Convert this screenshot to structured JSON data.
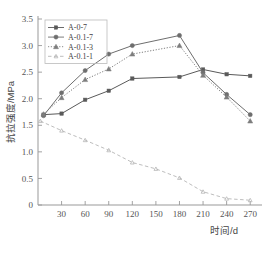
{
  "chart_data": {
    "type": "line",
    "title": "",
    "xlabel": "时间/d",
    "ylabel": "抗拉强度/MPa",
    "xlim": [
      0,
      285
    ],
    "ylim": [
      0,
      3.5
    ],
    "xticks": [
      30,
      60,
      90,
      120,
      150,
      180,
      210,
      240,
      270
    ],
    "xtick_labels": [
      "30",
      "60",
      "90",
      "120",
      "150",
      "180",
      "210",
      "240",
      "270"
    ],
    "yticks": [
      0,
      0.5,
      1.0,
      1.5,
      2.0,
      2.5,
      3.0,
      3.5
    ],
    "ytick_labels": [
      "0",
      "0.5",
      "1.0",
      "1.5",
      "2.0",
      "2.5",
      "3.0",
      "3.5"
    ],
    "grid": false,
    "legend_position": "upper-left",
    "series": [
      {
        "name": "A-0-7",
        "marker": "square",
        "linestyle": "solid",
        "color": "#5a5a5a",
        "x": [
          7,
          30,
          60,
          90,
          120,
          180,
          210,
          240,
          270
        ],
        "values": [
          1.7,
          1.72,
          1.98,
          2.15,
          2.38,
          2.41,
          2.55,
          2.46,
          2.43
        ]
      },
      {
        "name": "A-0.1-7",
        "marker": "circle",
        "linestyle": "solid",
        "color": "#6e6e6e",
        "x": [
          7,
          30,
          60,
          90,
          120,
          180,
          210,
          240,
          270
        ],
        "values": [
          1.68,
          2.11,
          2.53,
          2.84,
          3.0,
          3.19,
          2.49,
          2.08,
          1.7
        ]
      },
      {
        "name": "A-0.1-3",
        "marker": "triangle",
        "linestyle": "dotted",
        "color": "#7d7d7d",
        "x": [
          7,
          30,
          60,
          90,
          120,
          180,
          210,
          240,
          270
        ],
        "values": [
          1.71,
          2.02,
          2.36,
          2.56,
          2.84,
          3.0,
          2.44,
          2.03,
          1.58
        ]
      },
      {
        "name": "A-0.1-1",
        "marker": "small-triangle",
        "linestyle": "dashed",
        "color": "#b5b5b5",
        "x": [
          3,
          30,
          60,
          90,
          120,
          150,
          180,
          210,
          240,
          270
        ],
        "values": [
          1.58,
          1.4,
          1.22,
          1.03,
          0.8,
          0.68,
          0.51,
          0.25,
          0.12,
          0.09
        ]
      }
    ]
  },
  "axes": {
    "y_title": "抗拉强度/MPa",
    "x_title": "时间/d"
  },
  "legend": {
    "entries": [
      {
        "label": "A-0-7"
      },
      {
        "label": "A-0.1-7"
      },
      {
        "label": "A-0.1-3"
      },
      {
        "label": "A-0.1-1"
      }
    ]
  }
}
